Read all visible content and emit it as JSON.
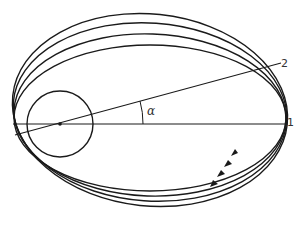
{
  "diagram": {
    "labels": {
      "point_1": "1",
      "point_2": "2",
      "angle": "α"
    },
    "colors": {
      "stroke": "#1a1a1a",
      "background": "#ffffff",
      "label": "#333333"
    },
    "central_body": {
      "cx": 60,
      "cy": 124,
      "r": 33
    },
    "orbits": [
      {
        "id": "orbit-1",
        "cx": 150,
        "cy": 108,
        "rx": 138,
        "ry": 95,
        "rotate": 7
      },
      {
        "id": "orbit-2",
        "cx": 150,
        "cy": 111,
        "rx": 137,
        "ry": 88,
        "rotate": 4.5
      },
      {
        "id": "orbit-3",
        "cx": 150,
        "cy": 114,
        "rx": 136,
        "ry": 80,
        "rotate": 2.5
      },
      {
        "id": "orbit-4",
        "cx": 150,
        "cy": 117,
        "rx": 135,
        "ry": 72,
        "rotate": 0.5
      }
    ]
  }
}
